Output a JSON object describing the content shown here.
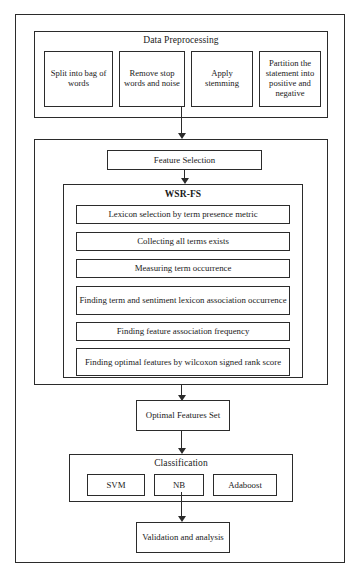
{
  "diagram": {
    "line_color": "#2b2b2b",
    "background_color": "#ffffff"
  },
  "preprocessing": {
    "title": "Data Preprocessing",
    "steps": [
      {
        "label": "Split into bag of words"
      },
      {
        "label": "Remove stop words and noise"
      },
      {
        "label": "Apply stemming"
      },
      {
        "label": "Partition the statement into positive and negative"
      }
    ]
  },
  "feature_selection": {
    "title": "Feature Selection",
    "wsr_fs": {
      "title": "WSR-FS",
      "steps": [
        {
          "label": "Lexicon selection by term presence metric"
        },
        {
          "label": "Collecting all terms exists"
        },
        {
          "label": "Measuring term occurrence"
        },
        {
          "label": "Finding term and sentiment lexicon association occurrence"
        },
        {
          "label": "Finding feature association frequency"
        },
        {
          "label": "Finding optimal features by wilcoxon signed rank score"
        }
      ]
    }
  },
  "optimal_features": {
    "label": "Optimal Features Set"
  },
  "classification": {
    "title": "Classification",
    "classifiers": [
      {
        "label": "SVM"
      },
      {
        "label": "NB"
      },
      {
        "label": "Adaboost"
      }
    ]
  },
  "validation": {
    "label": "Validation and analysis"
  },
  "arrows": [
    {
      "name": "preprocessing-to-feature-selection"
    },
    {
      "name": "feature-selection-to-wsr-fs"
    },
    {
      "name": "wsr-fs-to-optimal-features"
    },
    {
      "name": "optimal-features-to-classification"
    },
    {
      "name": "classification-to-validation"
    }
  ]
}
